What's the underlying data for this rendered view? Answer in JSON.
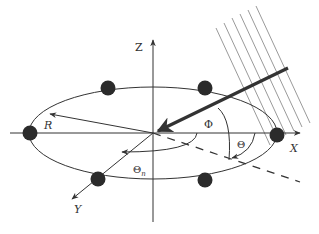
{
  "diagram": {
    "type": "3d-coordinate-geometry",
    "labels": {
      "z_axis": "Z",
      "x_axis": "X",
      "y_axis": "Y",
      "radius": "R",
      "elevation_angle": "Φ",
      "azimuth_angle": "Θ",
      "element_angle_main": "Θ",
      "element_angle_sub": "n"
    },
    "elements": {
      "count": 6,
      "positions": [
        {
          "x": 30,
          "y": 132
        },
        {
          "x": 108,
          "y": 88
        },
        {
          "x": 205,
          "y": 88
        },
        {
          "x": 277,
          "y": 133
        },
        {
          "x": 205,
          "y": 180
        },
        {
          "x": 98,
          "y": 179
        }
      ]
    },
    "wavefront_lines": 6,
    "colors": {
      "stroke": "#333333",
      "wavefront": "#9a9a9a",
      "dot": "#2b2b2b"
    }
  }
}
